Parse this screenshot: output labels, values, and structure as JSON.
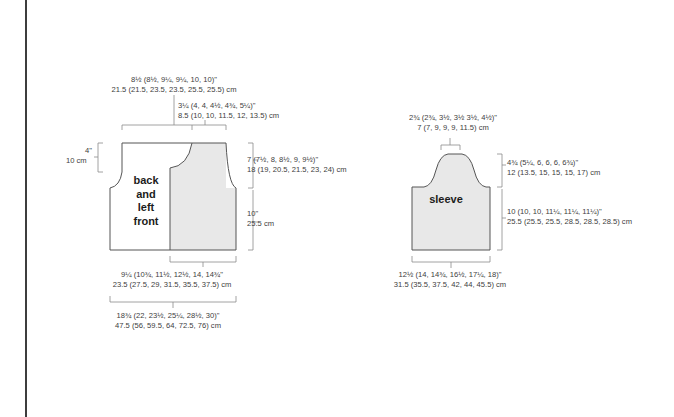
{
  "colors": {
    "outline": "#555555",
    "dim_line": "#8a8a8a",
    "fill_gray": "#e8e8e8",
    "text": "#404040",
    "frame": "#3d3d3d"
  },
  "body_piece": {
    "label_lines": [
      "back",
      "and",
      "left",
      "front"
    ],
    "dimensions": {
      "shoulder_width": {
        "in": "8½ (8½, 9¼, 9¼, 10, 10)\"",
        "cm": "21.5 (21.5, 23.5, 23.5, 25.5, 25.5) cm"
      },
      "front_neck_width": {
        "in": "3¼ (4, 4, 4½, 4¾, 5¼)\"",
        "cm": "8.5 (10, 10, 11.5, 12, 13.5) cm"
      },
      "neck_depth": {
        "in": "4\"",
        "cm": "10 cm"
      },
      "armhole_depth": {
        "in": "7 (7½, 8, 8½, 9, 9½)\"",
        "cm": "18 (19, 20.5, 21.5, 23, 24) cm"
      },
      "side_length": {
        "in": "10\"",
        "cm": "25.5 cm"
      },
      "front_width": {
        "in": "9¼ (10¾, 11½, 12½, 14, 14¾\"",
        "cm": "23.5 (27.5, 29, 31.5, 35.5, 37.5) cm"
      },
      "back_width": {
        "in": "18¾ (22, 23½, 25¼, 28½, 30)\"",
        "cm": "47.5 (56, 59.5, 64, 72.5, 76) cm"
      }
    }
  },
  "sleeve_piece": {
    "label": "sleeve",
    "dimensions": {
      "cap_top_width": {
        "in": "2¾ (2¾, 3½, 3½ 3½, 4½)\"",
        "cm": "7 (7, 9, 9, 9, 11.5) cm"
      },
      "cap_height": {
        "in": "4¾ (5¼, 6, 6, 6, 6¾)\"",
        "cm": "12 (13.5, 15, 15, 15, 17) cm"
      },
      "sleeve_length": {
        "in": "10 (10, 10, 11¼, 11¼, 11¼)\"",
        "cm": "25.5 (25.5, 25.5, 28.5, 28.5, 28.5) cm"
      },
      "sleeve_width": {
        "in": "12½ (14, 14¾, 16½, 17¼, 18)\"",
        "cm": "31.5 (35.5, 37.5, 42, 44, 45.5) cm"
      }
    }
  }
}
